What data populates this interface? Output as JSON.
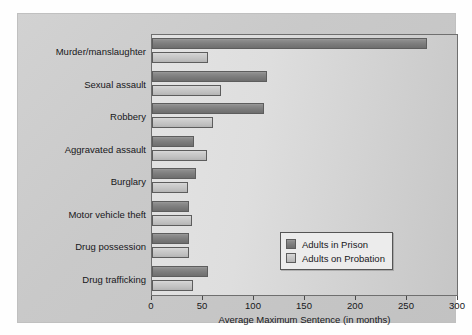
{
  "chart_data": {
    "type": "bar",
    "orientation": "horizontal",
    "title": "",
    "xlabel": "Average Maximum Sentence (in months)",
    "ylabel": "",
    "xlim": [
      0,
      300
    ],
    "xticks": [
      0,
      50,
      100,
      150,
      200,
      250,
      300
    ],
    "xtick_labels": [
      "0",
      "50",
      "100",
      "150",
      "200",
      "250",
      "300"
    ],
    "grid": false,
    "legend_position": "lower-right-inside",
    "categories": [
      "Murder/manslaughter",
      "Sexual assault",
      "Robbery",
      "Aggravated assault",
      "Burglary",
      "Motor vehicle theft",
      "Drug possession",
      "Drug trafficking"
    ],
    "series": [
      {
        "name": "Adults in Prison",
        "color": "#7c7c7c",
        "values": [
          270,
          113,
          110,
          41,
          43,
          36,
          36,
          55
        ]
      },
      {
        "name": "Adults on Probation",
        "color": "#c4c4c4",
        "values": [
          55,
          68,
          60,
          54,
          35,
          39,
          36,
          40
        ]
      }
    ]
  },
  "legend": {
    "entries": [
      {
        "label": "Adults in Prison",
        "swatch": "prison"
      },
      {
        "label": "Adults on Probation",
        "swatch": "probation"
      }
    ]
  },
  "colors": {
    "panel_background": "#cbcbcb",
    "plot_background": "#dcdcdc",
    "axis_line": "#6f6f6f",
    "text": "#17171a",
    "series_prison": "#7c7c7c",
    "series_probation": "#c4c4c4"
  }
}
